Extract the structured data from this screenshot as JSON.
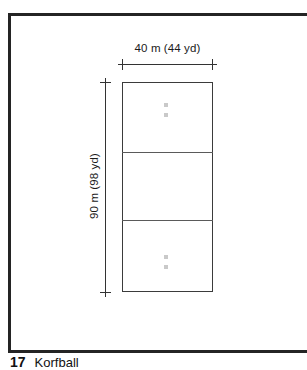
{
  "figure": {
    "caption_number": "17",
    "caption_title": "Korfball",
    "field": {
      "width_label": "40 m (44 yd)",
      "height_label": "90 m (98 yd)",
      "zones": 3,
      "post_marker_name": "korfball-post"
    }
  },
  "colors": {
    "frame": "#242424",
    "field_outline": "#3b3b3b",
    "zone_line": "#5a5a5a",
    "dimension_line": "#333333",
    "post_marker": "#c9c9c9",
    "background": "#ffffff"
  }
}
